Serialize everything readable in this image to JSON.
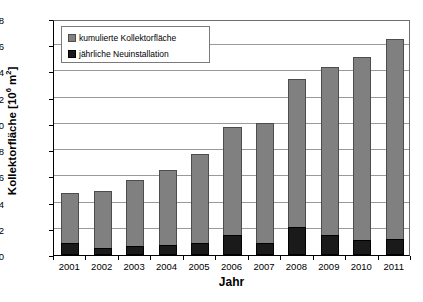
{
  "chart_data": {
    "type": "bar",
    "stacked": true,
    "title": "",
    "xlabel": "Jahr",
    "ylabel": "Kollektorfläche [10⁶ m²]",
    "ylabel_parts": {
      "prefix": "Kollektorfläche [10",
      "exponent": "6",
      "middle": " m",
      "exponent2": "2",
      "suffix": "]"
    },
    "categories": [
      "2001",
      "2002",
      "2003",
      "2004",
      "2005",
      "2006",
      "2007",
      "2008",
      "2009",
      "2010",
      "2011"
    ],
    "ylim": [
      0,
      18
    ],
    "yticks": [
      0,
      2,
      4,
      6,
      8,
      10,
      12,
      14,
      16,
      18
    ],
    "ytick_labels": [
      "0",
      "2",
      "4",
      "6",
      "8",
      "10",
      "12",
      "14",
      "16",
      "18"
    ],
    "grid": true,
    "legend_position": "top-left",
    "series": [
      {
        "name": "kumulierte Kollektorfläche",
        "color": "#808080",
        "values": [
          4.7,
          4.9,
          5.75,
          6.5,
          7.7,
          9.75,
          10.1,
          13.4,
          14.35,
          15.1,
          16.5
        ]
      },
      {
        "name": "jährliche Neuinstallation",
        "color": "#1a1a1a",
        "values": [
          0.9,
          0.55,
          0.7,
          0.75,
          0.95,
          1.5,
          0.95,
          2.1,
          1.55,
          1.15,
          1.25
        ]
      }
    ]
  },
  "legend": {
    "items": [
      {
        "label": "kumulierte Kollektorfläche",
        "marker": "square-gray"
      },
      {
        "label": "jährliche Neuinstallation",
        "marker": "square-black"
      }
    ]
  },
  "axes": {
    "x_title": "Jahr",
    "y_title": "Kollektorfläche [10⁶ m²]"
  }
}
